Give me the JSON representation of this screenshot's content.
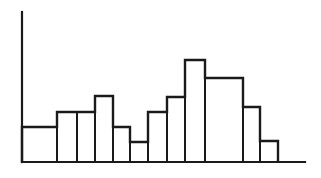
{
  "figure": {
    "background_color": "#ffffff",
    "line_color": "#1a1a1a",
    "axis_color": "#1a1a1a",
    "width": 321,
    "height": 178
  },
  "axes": {
    "y_axis": {
      "x": 22,
      "y_top": 12,
      "y_bottom": 162,
      "stroke_width": 2.2
    },
    "x_axis": {
      "y": 162,
      "x_left": 22,
      "x_right": 305,
      "stroke_width": 2.2
    },
    "baseline_y": 162
  },
  "chart_data": {
    "type": "bar",
    "title": "",
    "subtitle": "",
    "xlabel": "",
    "ylabel": "",
    "grid": false,
    "legend": null,
    "legend_position": "none",
    "categories": [
      "1",
      "2",
      "3",
      "4",
      "5",
      "6",
      "7",
      "8",
      "9",
      "10",
      "11",
      "12"
    ],
    "values": [
      35,
      50,
      50,
      66,
      35,
      20,
      50,
      65,
      102,
      84,
      55,
      21
    ],
    "bar_edges_px": [
      22,
      57,
      77,
      95,
      113,
      130,
      148,
      167,
      185,
      205,
      243,
      260,
      278
    ],
    "bar_tops_px": [
      127,
      112,
      112,
      96,
      127,
      142,
      112,
      97,
      60,
      78,
      107,
      141
    ],
    "ylim": [
      0,
      150
    ],
    "xlim": [
      0,
      12
    ],
    "bar_fill": "#ffffff",
    "bar_stroke": "#1a1a1a",
    "bar_stroke_width": 2.0
  }
}
